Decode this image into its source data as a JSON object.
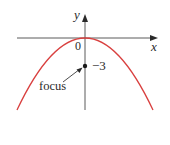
{
  "figure": {
    "type": "parabola-diagram",
    "equation_implied": "x^2 = -12y",
    "colors": {
      "curve": "#d9403f",
      "axes": "#5a5a5a",
      "text": "#2a2a2a",
      "point": "#1a1a1a"
    },
    "labels": {
      "y_axis": "y",
      "x_axis": "x",
      "origin": "0",
      "focus_value": "−3",
      "focus_annotation": "focus"
    },
    "focus": {
      "x": 0,
      "y": -3
    },
    "vertex": {
      "x": 0,
      "y": 0
    }
  }
}
